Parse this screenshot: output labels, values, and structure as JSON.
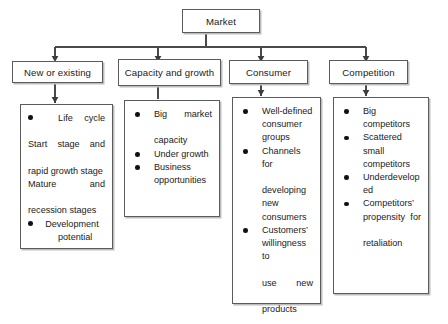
{
  "diagram": {
    "type": "hierarchy-tree",
    "orientation": "top-down",
    "root": {
      "label": "Market"
    },
    "branches": [
      {
        "header": "New or existing",
        "items": [
          {
            "bullet": true,
            "lines": [
              "Life cycle",
              "Start stage and",
              "rapid growth stage",
              "Mature and",
              "recession stages"
            ]
          },
          {
            "bullet": true,
            "lines": [
              "Development",
              "potential"
            ]
          }
        ]
      },
      {
        "header": "Capacity and growth",
        "items": [
          {
            "bullet": true,
            "lines": [
              "Big market",
              "capacity"
            ]
          },
          {
            "bullet": true,
            "lines": [
              "Under growth"
            ]
          },
          {
            "bullet": true,
            "lines": [
              "Business",
              "opportunities"
            ]
          }
        ]
      },
      {
        "header": "Consumer",
        "items": [
          {
            "bullet": true,
            "lines": [
              "Well-defined",
              "consumer",
              "groups"
            ]
          },
          {
            "bullet": true,
            "lines": [
              "Channels for",
              "developing",
              "new",
              "consumers"
            ]
          },
          {
            "bullet": true,
            "lines": [
              "Customers’",
              "willingness to",
              "use new",
              "products"
            ]
          }
        ]
      },
      {
        "header": "Competition",
        "items": [
          {
            "bullet": true,
            "lines": [
              "Big",
              "competitors"
            ]
          },
          {
            "bullet": true,
            "lines": [
              "Scattered",
              "small",
              "competitors"
            ]
          },
          {
            "bullet": true,
            "lines": [
              "Underdevelop",
              "ed"
            ]
          },
          {
            "bullet": true,
            "lines": [
              "Competitors’",
              "propensity for",
              "retaliation"
            ]
          }
        ]
      }
    ],
    "style": {
      "box_border_color": "#5b5b5b",
      "box_shadow_color": "#bdbdbd",
      "connector_color": "#4a4a4a",
      "background": "#ffffff",
      "text_color": "#1a1a1a",
      "bullet_color": "#111111"
    }
  }
}
